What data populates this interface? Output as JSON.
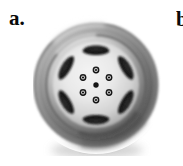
{
  "figure": {
    "panel_label": "a.",
    "next_panel_label_partial": "b.",
    "background_color": "#ffffff",
    "colors": {
      "background": "#ffffff",
      "tire_dark": "#4a4a4a",
      "tire_mid": "#8d8d8d",
      "tire_highlight": "#d8d8d8",
      "rim_lip_dark": "#5c5c5c",
      "hub_face_light": "#ebebeb",
      "hub_face_shade": "#b6b6b6",
      "spoke_cutout": "#1e1e1e",
      "lug_bolt": "#141414",
      "center_hub_dot": "#1a1a1a",
      "drop_shadow": "#bdbdbd"
    },
    "geometry": {
      "wheel_center_x": 63,
      "wheel_center_y": 71,
      "tire_outer_radius": 62,
      "tire_inner_radius": 50,
      "hub_face_radius": 43,
      "lug_circle_radius": 15,
      "lug_bolt_count": 6,
      "lug_bolt_radius": 3.2,
      "center_dot_radius": 2.6,
      "spoke_cutout_count": 6
    },
    "lug_bolts": [
      {
        "index": 1,
        "angle_deg": 270
      },
      {
        "index": 2,
        "angle_deg": 330
      },
      {
        "index": 3,
        "angle_deg": 30
      },
      {
        "index": 4,
        "angle_deg": 90
      },
      {
        "index": 5,
        "angle_deg": 150
      },
      {
        "index": 6,
        "angle_deg": 210
      }
    ],
    "spoke_cutouts": [
      {
        "index": 1,
        "angle_deg": 270
      },
      {
        "index": 2,
        "angle_deg": 330
      },
      {
        "index": 3,
        "angle_deg": 30
      },
      {
        "index": 4,
        "angle_deg": 90
      },
      {
        "index": 5,
        "angle_deg": 150
      },
      {
        "index": 6,
        "angle_deg": 210
      }
    ]
  }
}
